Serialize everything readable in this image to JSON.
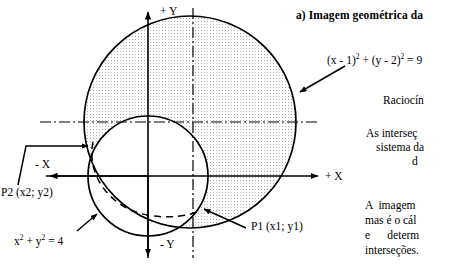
{
  "figure": {
    "title": "a) Imagem geométrica da",
    "axes": {
      "x_positive": "+ X",
      "x_negative": "- X",
      "y_positive": "+ Y",
      "y_negative": "- Y"
    },
    "equations": {
      "big_circle": {
        "base": "(x - 1)",
        "exp1": "2",
        "mid": " + (y - 2)",
        "exp2": "2",
        "tail": " = 9"
      },
      "small_circle": {
        "base": "x",
        "exp1": "2",
        "mid": " + y",
        "exp2": "2",
        "tail": " = 4"
      }
    },
    "points": {
      "p1": "P1 (x1; y1)",
      "p2": "P2 (x2; y2)"
    },
    "colors": {
      "stroke": "#000000",
      "fill_dots": "#b4b4b4",
      "background": "#ffffff"
    },
    "geometry": {
      "big_circle": {
        "cx": 190,
        "cy": 122,
        "r": 106
      },
      "small_circle": {
        "cx": 148,
        "cy": 176,
        "r": 60
      },
      "y_axis_x": 148,
      "x_axis_y": 176,
      "center_line_h_y": 122,
      "center_line_v_x": 193
    }
  },
  "sidebar_text": {
    "line1": "Raciocín",
    "line2": "As interseç",
    "line3": "sistema da",
    "line4": "d",
    "line5": "A  imagem",
    "line6": "mas é o cál",
    "line7": "e      determ",
    "line8": "interseções."
  }
}
